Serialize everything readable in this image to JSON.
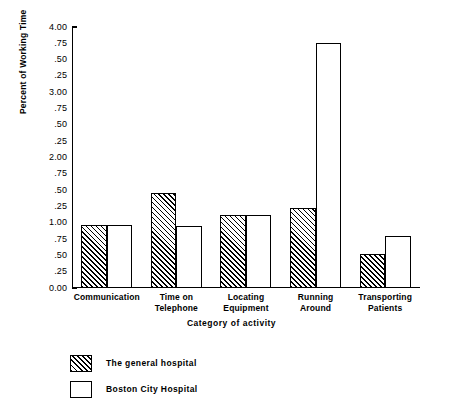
{
  "chart_data": {
    "type": "bar",
    "title": "",
    "xlabel": "Category of activity",
    "ylabel": "Percent of Working Time",
    "categories": [
      "Communication",
      "Time on Telephone",
      "Locating Equipment",
      "Running Around",
      "Transporting Patients"
    ],
    "category_lines": [
      [
        "Communication"
      ],
      [
        "Time on",
        "Telephone"
      ],
      [
        "Locating",
        "Equipment"
      ],
      [
        "Running",
        "Around"
      ],
      [
        "Transporting",
        "Patients"
      ]
    ],
    "series": [
      {
        "name": "The general hospital",
        "fill": "hatched",
        "values": [
          0.97,
          1.45,
          1.12,
          1.22,
          0.52
        ]
      },
      {
        "name": "Boston City Hospital",
        "fill": "white",
        "values": [
          0.97,
          0.95,
          1.12,
          3.75,
          0.8
        ]
      }
    ],
    "ylim": [
      0.0,
      4.0
    ],
    "ytick_values": [
      0.0,
      0.25,
      0.5,
      0.75,
      1.0,
      1.25,
      1.5,
      1.75,
      2.0,
      2.25,
      2.5,
      2.75,
      3.0,
      3.25,
      3.5,
      3.75,
      4.0
    ],
    "ytick_labels": [
      "0.00",
      ".25",
      ".50",
      ".75",
      "1.00",
      ".25",
      ".50",
      ".75",
      "2.00",
      ".25",
      ".50",
      ".75",
      "3.00",
      ".25",
      ".50",
      ".75",
      "4.00"
    ],
    "grid": false,
    "legend_position": "below-left",
    "colors": {
      "axis": "#000000",
      "bar_outline": "#000000",
      "hatch": "#000000",
      "background": "#ffffff"
    }
  },
  "legend": {
    "items": [
      {
        "label": "The general hospital",
        "fill": "hatched"
      },
      {
        "label": "Boston City Hospital",
        "fill": "white"
      }
    ]
  }
}
